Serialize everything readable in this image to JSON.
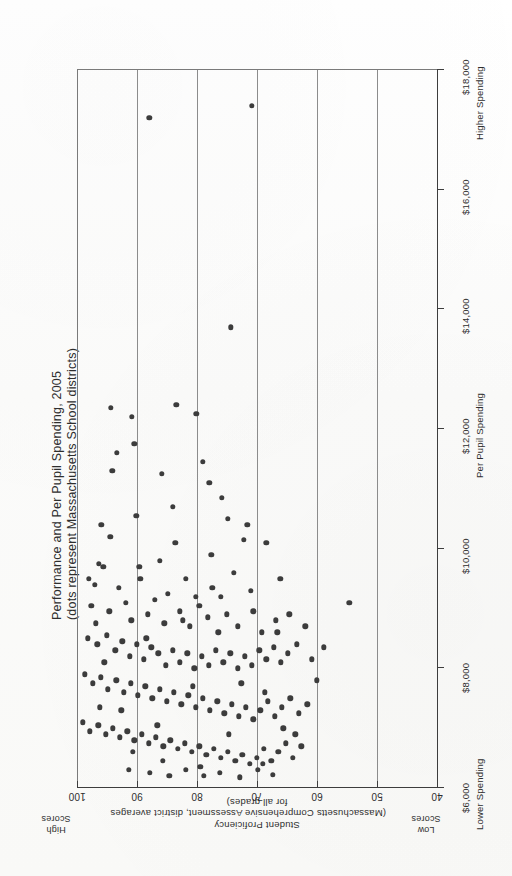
{
  "chart_data": {
    "type": "scatter",
    "title": "Performance and Per Pupil Spending, 2005",
    "subtitle": "(dots represent Massachusetts School districts)",
    "xlabel": "Student Proficiency",
    "xlabel_sub1": "(Massachusetts Comprehensive Assessment, district averages",
    "xlabel_sub2": "for all grades)",
    "ylabel": "Per Pupil Spending",
    "x_ticks": [
      "100",
      "90",
      "80",
      "70",
      "60",
      "50",
      "40"
    ],
    "x_tick_values": [
      100,
      90,
      80,
      70,
      60,
      50,
      40
    ],
    "y_ticks": [
      "$18,000",
      "$16,000",
      "$14,000",
      "$12,000",
      "$10,000",
      "$8,000",
      "$6,000"
    ],
    "y_tick_values": [
      18000,
      16000,
      14000,
      12000,
      10000,
      8000,
      6000
    ],
    "xlim": [
      100,
      40
    ],
    "ylim": [
      6000,
      18000
    ],
    "grid": "vertical-only",
    "legend": "none",
    "marker_color": "#3c3c3c",
    "marker_size_px": 5.4,
    "annotations": {
      "high_scores": "High\nScores",
      "low_scores": "Low\nScores",
      "higher_spending": "Higher Spending",
      "lower_spending": "Lower Spending"
    },
    "orientation_note": "page is rotated 90 degrees: proficiency axis runs left-to-right decreasing, spending axis runs bottom-to-top increasing",
    "points": [
      [
        88.1,
        17200
      ],
      [
        71.0,
        17400
      ],
      [
        74.5,
        13700
      ],
      [
        94.5,
        12350
      ],
      [
        91.0,
        12200
      ],
      [
        83.6,
        12400
      ],
      [
        80.3,
        12250
      ],
      [
        90.6,
        11750
      ],
      [
        93.5,
        11600
      ],
      [
        86.0,
        11250
      ],
      [
        79.2,
        11450
      ],
      [
        78.1,
        11100
      ],
      [
        94.3,
        11300
      ],
      [
        84.2,
        10700
      ],
      [
        90.3,
        10550
      ],
      [
        76.0,
        10850
      ],
      [
        75.0,
        10500
      ],
      [
        96.1,
        10400
      ],
      [
        72.4,
        10150
      ],
      [
        68.6,
        10100
      ],
      [
        96.5,
        9750
      ],
      [
        95.8,
        9700
      ],
      [
        86.4,
        9800
      ],
      [
        97.2,
        9400
      ],
      [
        93.2,
        9350
      ],
      [
        89.6,
        9500
      ],
      [
        85.0,
        9250
      ],
      [
        82.0,
        9500
      ],
      [
        80.4,
        9200
      ],
      [
        77.6,
        9350
      ],
      [
        74.0,
        9600
      ],
      [
        71.2,
        9300
      ],
      [
        66.3,
        9500
      ],
      [
        97.8,
        9050
      ],
      [
        94.8,
        8950
      ],
      [
        92.0,
        9100
      ],
      [
        91.1,
        8800
      ],
      [
        88.4,
        8900
      ],
      [
        87.2,
        9150
      ],
      [
        85.6,
        8750
      ],
      [
        83.0,
        8950
      ],
      [
        81.4,
        8700
      ],
      [
        79.8,
        9050
      ],
      [
        78.4,
        8850
      ],
      [
        76.6,
        8600
      ],
      [
        75.2,
        8900
      ],
      [
        73.4,
        8700
      ],
      [
        70.8,
        8950
      ],
      [
        69.4,
        8600
      ],
      [
        67.0,
        8800
      ],
      [
        64.8,
        8900
      ],
      [
        62.1,
        8700
      ],
      [
        98.4,
        8500
      ],
      [
        96.8,
        8400
      ],
      [
        95.2,
        8550
      ],
      [
        93.8,
        8300
      ],
      [
        92.6,
        8450
      ],
      [
        91.4,
        8200
      ],
      [
        90.2,
        8400
      ],
      [
        89.0,
        8150
      ],
      [
        87.8,
        8350
      ],
      [
        86.6,
        8250
      ],
      [
        85.4,
        8050
      ],
      [
        84.2,
        8300
      ],
      [
        83.0,
        8100
      ],
      [
        81.8,
        8250
      ],
      [
        80.6,
        8000
      ],
      [
        79.4,
        8200
      ],
      [
        78.2,
        8050
      ],
      [
        77.0,
        8300
      ],
      [
        75.8,
        8100
      ],
      [
        74.6,
        8250
      ],
      [
        73.4,
        8000
      ],
      [
        72.2,
        8200
      ],
      [
        71.0,
        8050
      ],
      [
        69.8,
        8300
      ],
      [
        68.6,
        8150
      ],
      [
        67.4,
        8350
      ],
      [
        66.2,
        8100
      ],
      [
        65.0,
        8250
      ],
      [
        63.5,
        8400
      ],
      [
        61.0,
        8150
      ],
      [
        59.0,
        8350
      ],
      [
        54.8,
        9100
      ],
      [
        98.9,
        7900
      ],
      [
        97.5,
        7750
      ],
      [
        96.2,
        7850
      ],
      [
        95.0,
        7650
      ],
      [
        93.6,
        7800
      ],
      [
        92.4,
        7600
      ],
      [
        91.2,
        7750
      ],
      [
        90.0,
        7550
      ],
      [
        88.8,
        7700
      ],
      [
        87.6,
        7500
      ],
      [
        86.4,
        7650
      ],
      [
        85.2,
        7450
      ],
      [
        84.0,
        7600
      ],
      [
        82.8,
        7400
      ],
      [
        81.6,
        7550
      ],
      [
        80.4,
        7350
      ],
      [
        79.2,
        7500
      ],
      [
        78.0,
        7300
      ],
      [
        76.8,
        7450
      ],
      [
        75.6,
        7250
      ],
      [
        74.4,
        7400
      ],
      [
        73.2,
        7200
      ],
      [
        72.0,
        7350
      ],
      [
        70.8,
        7150
      ],
      [
        69.6,
        7300
      ],
      [
        68.4,
        7450
      ],
      [
        67.2,
        7200
      ],
      [
        66.0,
        7350
      ],
      [
        64.6,
        7500
      ],
      [
        63.2,
        7250
      ],
      [
        61.8,
        7400
      ],
      [
        99.2,
        7100
      ],
      [
        98.0,
        6950
      ],
      [
        96.6,
        7050
      ],
      [
        95.4,
        6900
      ],
      [
        94.2,
        7000
      ],
      [
        93.0,
        6850
      ],
      [
        91.8,
        6950
      ],
      [
        90.6,
        6800
      ],
      [
        89.4,
        6900
      ],
      [
        88.2,
        6750
      ],
      [
        87.0,
        6850
      ],
      [
        85.8,
        6700
      ],
      [
        84.6,
        6800
      ],
      [
        83.4,
        6650
      ],
      [
        82.2,
        6750
      ],
      [
        81.0,
        6600
      ],
      [
        79.8,
        6700
      ],
      [
        78.6,
        6550
      ],
      [
        77.4,
        6650
      ],
      [
        76.2,
        6500
      ],
      [
        75.0,
        6600
      ],
      [
        73.8,
        6450
      ],
      [
        72.6,
        6550
      ],
      [
        71.4,
        6400
      ],
      [
        70.2,
        6500
      ],
      [
        69.0,
        6650
      ],
      [
        67.8,
        6450
      ],
      [
        66.6,
        6600
      ],
      [
        65.4,
        6750
      ],
      [
        64.2,
        6500
      ],
      [
        62.8,
        6700
      ],
      [
        91.5,
        6300
      ],
      [
        88.0,
        6250
      ],
      [
        84.8,
        6200
      ],
      [
        82.0,
        6300
      ],
      [
        79.0,
        6200
      ],
      [
        76.4,
        6250
      ],
      [
        73.0,
        6180
      ],
      [
        70.0,
        6300
      ],
      [
        67.5,
        6220
      ],
      [
        97.0,
        8750
      ],
      [
        95.6,
        8100
      ],
      [
        92.8,
        7300
      ],
      [
        89.8,
        9700
      ],
      [
        86.8,
        7050
      ],
      [
        83.8,
        10100
      ],
      [
        80.9,
        7700
      ],
      [
        77.8,
        9900
      ],
      [
        74.9,
        6900
      ],
      [
        71.8,
        10400
      ],
      [
        68.9,
        7600
      ],
      [
        65.8,
        7000
      ],
      [
        60.2,
        7800
      ],
      [
        98.2,
        9500
      ],
      [
        96.4,
        7350
      ],
      [
        94.6,
        10200
      ],
      [
        90.9,
        6600
      ],
      [
        88.6,
        8500
      ],
      [
        85.9,
        6450
      ],
      [
        82.5,
        8800
      ],
      [
        79.6,
        6350
      ],
      [
        76.2,
        9200
      ],
      [
        72.8,
        7750
      ],
      [
        69.2,
        6400
      ],
      [
        66.8,
        8600
      ],
      [
        63.8,
        6900
      ]
    ]
  }
}
